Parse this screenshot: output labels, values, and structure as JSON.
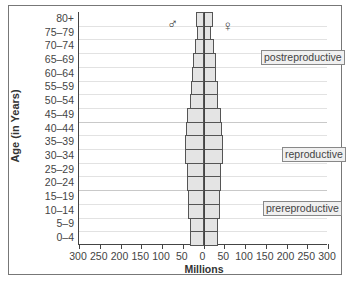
{
  "chart_data": {
    "type": "bar",
    "orientation": "horizontal",
    "subtype": "population-pyramid",
    "title": "",
    "xlabel": "Millions",
    "ylabel": "Age (in Years)",
    "xlim": [
      -300,
      300
    ],
    "x_ticks": [
      "300",
      "250",
      "200",
      "150",
      "100",
      "50",
      "0",
      "50",
      "100",
      "150",
      "200",
      "250",
      "300"
    ],
    "categories": [
      "80+",
      "75–79",
      "70–74",
      "65–69",
      "60–64",
      "55–59",
      "50–54",
      "45–49",
      "40–44",
      "35–39",
      "30–34",
      "25–29",
      "20–24",
      "15–19",
      "10–14",
      "5–9",
      "0–4"
    ],
    "series": [
      {
        "name": "Male",
        "symbol": "♂",
        "side": "left",
        "values": [
          19,
          16,
          22,
          27,
          29,
          31,
          33,
          40,
          43,
          47,
          46,
          41,
          41,
          38,
          38,
          35,
          33
        ]
      },
      {
        "name": "Female",
        "symbol": "♀",
        "side": "right",
        "values": [
          21,
          17,
          23,
          28,
          30,
          34,
          34,
          41,
          43,
          47,
          46,
          41,
          41,
          38,
          38,
          35,
          33
        ]
      }
    ],
    "annotations": [
      {
        "text": "postreproductive",
        "rows": [
          "80+",
          "75–79",
          "70–74",
          "65–69",
          "60–64",
          "55–59",
          "50–54",
          "45–49"
        ]
      },
      {
        "text": "reproductive",
        "rows": [
          "40–44",
          "35–39",
          "30–34",
          "25–29",
          "20–24"
        ]
      },
      {
        "text": "prereproductive",
        "rows": [
          "15–19",
          "10–14",
          "5–9",
          "0–4"
        ]
      }
    ],
    "grid": true,
    "legend": "symbols near top"
  },
  "labels": {
    "male_symbol": "♂",
    "female_symbol": "♀",
    "postreproductive": "postreproductive",
    "reproductive": "reproductive",
    "prereproductive": "prereproductive",
    "xlabel": "Millions",
    "ylabel": "Age (in Years)"
  }
}
